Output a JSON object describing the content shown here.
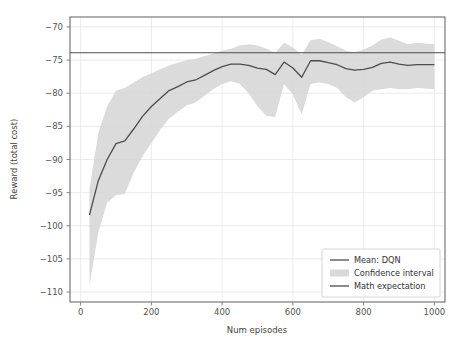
{
  "chart_data": {
    "type": "line",
    "title": "",
    "xlabel": "Num episodes",
    "ylabel": "Reward (total cost)",
    "xlim": [
      -30,
      1030
    ],
    "ylim": [
      -111.5,
      -68.5
    ],
    "xticks": [
      0,
      200,
      400,
      600,
      800,
      1000
    ],
    "xtick_labels": [
      "0",
      "200",
      "400",
      "600",
      "800",
      "1000"
    ],
    "yticks": [
      -70,
      -75,
      -80,
      -85,
      -90,
      -95,
      -100,
      -105,
      -110
    ],
    "ytick_labels": [
      "−70",
      "−75",
      "−80",
      "−85",
      "−90",
      "−95",
      "−100",
      "−105",
      "−110"
    ],
    "grid": true,
    "grid_color": "#e6e6e6",
    "background": "#ffffff",
    "legend_position": "lower right",
    "line_color": "#4d4d4d",
    "band_color": "#d5d5d5",
    "expectation_color": "#4d4d4d",
    "math_expectation_value": -73.9,
    "x": [
      25,
      50,
      75,
      100,
      125,
      150,
      175,
      200,
      225,
      250,
      275,
      300,
      325,
      350,
      375,
      400,
      425,
      450,
      475,
      500,
      525,
      550,
      575,
      600,
      625,
      650,
      675,
      700,
      725,
      750,
      775,
      800,
      825,
      850,
      875,
      900,
      925,
      950,
      975,
      1000
    ],
    "series": [
      {
        "name": "Mean: DQN",
        "values": [
          -98.4,
          -93.2,
          -90.0,
          -87.6,
          -87.2,
          -85.4,
          -83.5,
          -82.0,
          -80.8,
          -79.6,
          -79.0,
          -78.3,
          -78.0,
          -77.3,
          -76.6,
          -76.0,
          -75.6,
          -75.6,
          -75.8,
          -76.2,
          -76.4,
          -77.2,
          -75.3,
          -76.2,
          -77.6,
          -75.1,
          -75.1,
          -75.4,
          -75.7,
          -76.3,
          -76.5,
          -76.4,
          -76.1,
          -75.5,
          -75.3,
          -75.6,
          -75.8,
          -75.7,
          -75.7,
          -75.7
        ]
      },
      {
        "name": "Confidence interval upper",
        "values": [
          -94.5,
          -86.0,
          -82.0,
          -79.6,
          -79.2,
          -78.4,
          -77.6,
          -77.0,
          -76.4,
          -75.8,
          -75.4,
          -75.0,
          -74.8,
          -74.4,
          -74.0,
          -73.6,
          -73.3,
          -72.8,
          -72.6,
          -72.8,
          -73.3,
          -73.9,
          -72.4,
          -73.1,
          -74.2,
          -72.0,
          -71.8,
          -72.3,
          -72.9,
          -73.6,
          -73.8,
          -73.4,
          -72.8,
          -71.9,
          -71.6,
          -72.1,
          -72.6,
          -72.4,
          -72.5,
          -72.6
        ]
      },
      {
        "name": "Confidence interval lower",
        "values": [
          -109.0,
          -101.0,
          -96.5,
          -95.4,
          -95.2,
          -92.0,
          -89.5,
          -87.5,
          -85.5,
          -83.8,
          -82.8,
          -81.8,
          -81.4,
          -80.4,
          -79.4,
          -78.6,
          -78.2,
          -78.6,
          -80.0,
          -82.0,
          -83.4,
          -83.6,
          -78.6,
          -80.2,
          -83.2,
          -78.6,
          -78.4,
          -78.6,
          -79.2,
          -80.6,
          -81.4,
          -80.6,
          -79.6,
          -79.4,
          -79.2,
          -79.4,
          -79.4,
          -79.2,
          -79.3,
          -79.4
        ]
      }
    ],
    "legend_entries": [
      {
        "label": "Mean: DQN",
        "marker": "line"
      },
      {
        "label": "Confidence interval",
        "marker": "patch"
      },
      {
        "label": "Math expectation",
        "marker": "line"
      }
    ]
  }
}
